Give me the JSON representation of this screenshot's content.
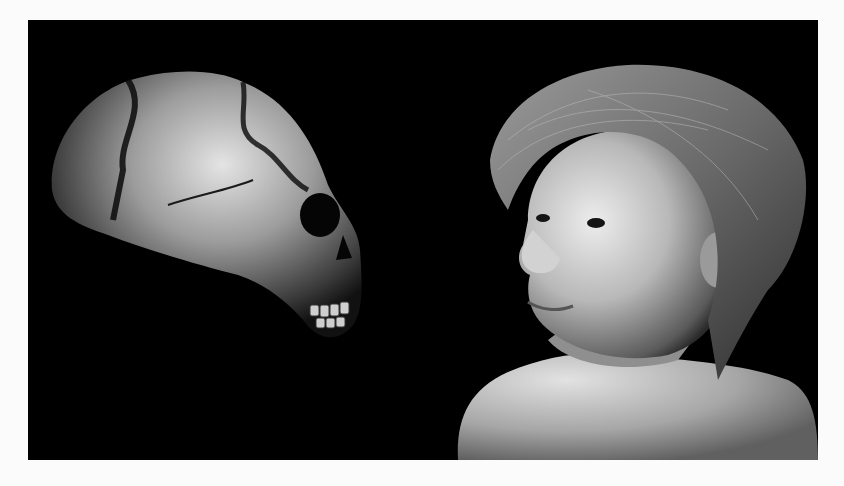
{
  "page": {
    "background": "#fbfbfb"
  },
  "photo": {
    "background": "#000000",
    "subjects": [
      {
        "name": "fossil-skull",
        "position": "left",
        "facing": "right"
      },
      {
        "name": "child-reconstruction",
        "position": "right",
        "facing": "left"
      }
    ],
    "palette": {
      "bone_light": "#d8d8d8",
      "bone_mid": "#8a8a8a",
      "skin_light": "#e6e6e6",
      "skin_mid": "#a8a8a8",
      "hair": "#6e6e6e"
    }
  }
}
